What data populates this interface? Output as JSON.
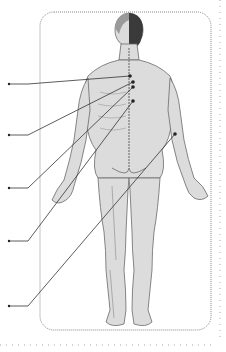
{
  "figure": {
    "type": "anatomical-diagram",
    "view": "posterior human body",
    "colors": {
      "background": "#ffffff",
      "frame": "#888888",
      "outer_border": "#aaaaaa",
      "body_fill": "#dcdcdc",
      "body_stroke": "#6a6a6a",
      "hair": "#3a3a3a",
      "leader": "#333333"
    },
    "callouts": [
      {
        "id": 1,
        "label": "",
        "point": [
          130,
          76
        ],
        "end": [
          9,
          84
        ],
        "elbow": [
          28,
          84
        ]
      },
      {
        "id": 2,
        "label": "",
        "point": [
          133,
          82
        ],
        "end": [
          9,
          135
        ],
        "elbow": [
          28,
          135
        ]
      },
      {
        "id": 3,
        "label": "",
        "point": [
          133,
          87
        ],
        "end": [
          9,
          188
        ],
        "elbow": [
          28,
          188
        ]
      },
      {
        "id": 4,
        "label": "",
        "point": [
          133,
          101
        ],
        "end": [
          9,
          241
        ],
        "elbow": [
          28,
          241
        ]
      },
      {
        "id": 5,
        "label": "",
        "point": [
          175,
          134
        ],
        "end": [
          9,
          306
        ],
        "elbow": [
          28,
          306
        ]
      }
    ]
  }
}
